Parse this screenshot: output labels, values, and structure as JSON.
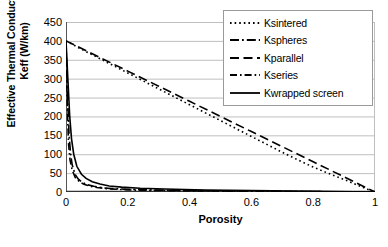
{
  "chart_data": {
    "type": "line",
    "title": "",
    "xlabel": "Porosity",
    "ylabel": "Effective Thermal Conductivity, Keff (W/km)",
    "ylabel_line1": "Effective Thermal Conductivity,",
    "ylabel_line2": "Keff  (W/km)",
    "xlim": [
      0,
      1
    ],
    "ylim": [
      0,
      450
    ],
    "xticks": [
      "0",
      "0.2",
      "0.4",
      "0.6",
      "0.8",
      "1"
    ],
    "xtick_values": [
      0,
      0.2,
      0.4,
      0.6,
      0.8,
      1
    ],
    "yticks": [
      "0",
      "50",
      "100",
      "150",
      "200",
      "250",
      "300",
      "350",
      "400",
      "450"
    ],
    "ytick_values": [
      0,
      50,
      100,
      150,
      200,
      250,
      300,
      350,
      400,
      450
    ],
    "grid": "horizontal",
    "legend_position": "top-right",
    "series": [
      {
        "name": "Ksintered",
        "style": "dotted",
        "x": [
          0,
          0.05,
          0.1,
          0.15,
          0.2,
          0.25,
          0.3,
          0.35,
          0.4,
          0.45,
          0.5,
          0.55,
          0.6,
          0.65,
          0.7,
          0.75,
          0.8,
          0.85,
          0.9,
          0.95,
          0.98,
          1
        ],
        "values": [
          400,
          378,
          357,
          336,
          315,
          294,
          273,
          252,
          231,
          210,
          189,
          168,
          147,
          126,
          105,
          85,
          66,
          49,
          33,
          16,
          6,
          0
        ]
      },
      {
        "name": "Kspheres",
        "style": "dash-dot",
        "x": [
          0,
          0.005,
          0.01,
          0.015,
          0.02,
          0.03,
          0.04,
          0.05,
          0.07,
          0.09,
          0.12,
          0.15,
          0.2,
          0.3,
          0.4,
          0.6,
          0.8,
          1
        ],
        "values": [
          400,
          250,
          150,
          100,
          72,
          46,
          34,
          27,
          19,
          15,
          11,
          9,
          7,
          5,
          4,
          2,
          1,
          0
        ]
      },
      {
        "name": "Kparallel",
        "style": "long-dash",
        "x": [
          0,
          0.1,
          0.2,
          0.3,
          0.4,
          0.5,
          0.6,
          0.7,
          0.8,
          0.9,
          1
        ],
        "values": [
          400,
          360,
          320,
          280,
          240,
          200,
          160,
          120,
          80,
          40,
          0
        ]
      },
      {
        "name": "Kseries",
        "style": "dash-dot-short",
        "x": [
          0,
          0.004,
          0.008,
          0.013,
          0.02,
          0.03,
          0.045,
          0.06,
          0.08,
          0.1,
          0.13,
          0.17,
          0.22,
          0.3,
          0.4,
          0.6,
          0.8,
          1
        ],
        "values": [
          400,
          230,
          130,
          85,
          58,
          38,
          26,
          20,
          15,
          12,
          9,
          7,
          5,
          4,
          3,
          2,
          1,
          0
        ]
      },
      {
        "name": "Kwrapped screen",
        "style": "solid",
        "x": [
          0,
          0.006,
          0.012,
          0.018,
          0.025,
          0.035,
          0.05,
          0.065,
          0.085,
          0.11,
          0.14,
          0.18,
          0.24,
          0.32,
          0.45,
          0.6,
          0.8,
          1
        ],
        "values": [
          400,
          300,
          200,
          140,
          100,
          68,
          47,
          36,
          27,
          21,
          16,
          13,
          10,
          8,
          5,
          4,
          2,
          0
        ]
      }
    ]
  },
  "legend": {
    "items": [
      {
        "label": "Ksintered"
      },
      {
        "label": "Kspheres"
      },
      {
        "label": "Kparallel"
      },
      {
        "label": "Kseries"
      },
      {
        "label": "Kwrapped screen"
      }
    ]
  },
  "caption": {
    "text": ""
  },
  "colors": {
    "line": "#000000",
    "grid": "#bfbfbf",
    "axis": "#808080",
    "background": "#ffffff"
  }
}
